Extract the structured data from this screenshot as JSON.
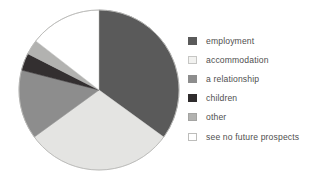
{
  "chart_data": {
    "type": "pie",
    "title": "",
    "subtitle": "",
    "xlabel": "",
    "ylabel": "",
    "grid": false,
    "legend_position": "right",
    "start_angle_deg": 0,
    "direction": "clockwise",
    "categories": [
      "employment",
      "accommodation",
      "a relationship",
      "children",
      "other",
      "see no future prospects"
    ],
    "values": [
      35,
      30,
      14,
      3.5,
      3,
      14.5
    ],
    "slices": [
      {
        "label": "employment",
        "value": 35,
        "color": "#5a5a5a",
        "border": "#5a5a5a",
        "start_deg": 0,
        "end_deg": 126
      },
      {
        "label": "accommodation",
        "value": 30,
        "color": "#e4e4e2",
        "border": "#cfcfcd",
        "start_deg": 126,
        "end_deg": 234
      },
      {
        "label": "a relationship",
        "value": 14,
        "color": "#8d8d8d",
        "border": "#8d8d8d",
        "start_deg": 234,
        "end_deg": 284.4
      },
      {
        "label": "children",
        "value": 3.5,
        "color": "#332f30",
        "border": "#332f30",
        "start_deg": 284.4,
        "end_deg": 297
      },
      {
        "label": "other",
        "value": 3,
        "color": "#b2b2b0",
        "border": "#b2b2b0",
        "start_deg": 297,
        "end_deg": 307.8
      },
      {
        "label": "see no future prospects",
        "value": 14.5,
        "color": "#ffffff",
        "border": "#bdbdbb",
        "start_deg": 307.8,
        "end_deg": 360
      }
    ],
    "geometry": {
      "center_x": 99,
      "center_y": 90,
      "radius": 80,
      "outline_color": "#b9b9b7"
    }
  },
  "legend": {
    "items": [
      {
        "label": "employment",
        "swatch_color": "#5a5a5a",
        "swatch_border": "#5a5a5a"
      },
      {
        "label": "accommodation",
        "swatch_color": "#f2f2f0",
        "swatch_border": "#c6c6c4"
      },
      {
        "label": "a relationship",
        "swatch_color": "#8d8d8d",
        "swatch_border": "#8d8d8d"
      },
      {
        "label": "children",
        "swatch_color": "#2f2c2d",
        "swatch_border": "#2f2c2d"
      },
      {
        "label": "other",
        "swatch_color": "#b2b2b0",
        "swatch_border": "#a4a4a2"
      },
      {
        "label": "see no future prospects",
        "swatch_color": "#ffffff",
        "swatch_border": "#bdbdbb"
      }
    ]
  }
}
